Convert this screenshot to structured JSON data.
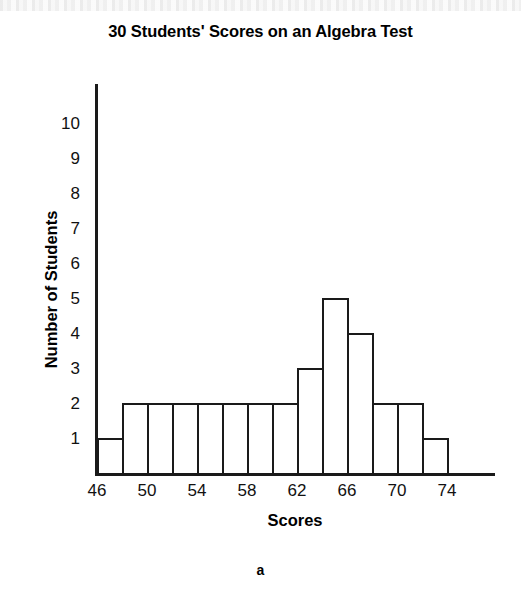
{
  "figure": {
    "caption": "a"
  },
  "chart_data": {
    "type": "bar",
    "title": "30 Students' Scores on an Algebra Test",
    "xlabel": "Scores",
    "ylabel": "Number of Students",
    "xlim": [
      46,
      76
    ],
    "ylim": [
      0,
      10.7
    ],
    "grid": false,
    "legend": null,
    "bin_width": 2,
    "x_tick_labels": [
      "46",
      "50",
      "54",
      "58",
      "62",
      "66",
      "70",
      "74"
    ],
    "x_tick_values": [
      46,
      50,
      54,
      58,
      62,
      66,
      70,
      74
    ],
    "y_tick_labels": [
      "1",
      "2",
      "3",
      "4",
      "5",
      "6",
      "7",
      "8",
      "9",
      "10"
    ],
    "y_tick_values": [
      1,
      2,
      3,
      4,
      5,
      6,
      7,
      8,
      9,
      10
    ],
    "categories": [
      "46-48",
      "48-50",
      "50-52",
      "52-54",
      "54-56",
      "56-58",
      "58-60",
      "60-62",
      "62-64",
      "64-66",
      "66-68",
      "68-70",
      "70-72",
      "72-74"
    ],
    "bin_edges": [
      46,
      48,
      50,
      52,
      54,
      56,
      58,
      60,
      62,
      64,
      66,
      68,
      70,
      72,
      74
    ],
    "values": [
      1,
      2,
      2,
      2,
      2,
      2,
      2,
      2,
      3,
      5,
      4,
      2,
      2,
      1
    ],
    "total": 30
  },
  "style": {
    "line_color": "#1a1a1a",
    "bar_fill": "#ffffff",
    "text_color": "#000000",
    "background": "#ffffff"
  }
}
